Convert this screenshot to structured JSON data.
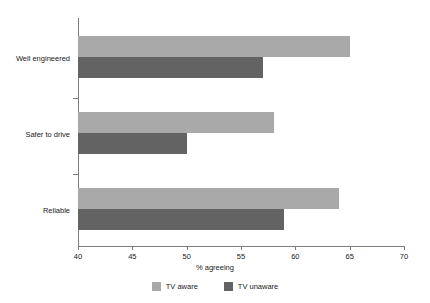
{
  "chart_data": {
    "type": "bar",
    "orientation": "horizontal",
    "title": "",
    "subtitle": "",
    "xlabel": "% agreeing",
    "ylabel": "",
    "xlim": [
      40,
      70
    ],
    "xticks": [
      40,
      45,
      50,
      55,
      60,
      65,
      70
    ],
    "xtick_labels": [
      "40",
      "45",
      "50",
      "55",
      "60",
      "65",
      "70"
    ],
    "grid": false,
    "legend_position": "bottom",
    "categories": [
      "Well engineered",
      "Safer to drive",
      "Reliable"
    ],
    "series": [
      {
        "name": "TV aware",
        "color": "#a9a9a9",
        "values": [
          65,
          58,
          64
        ]
      },
      {
        "name": "TV unaware",
        "color": "#636363",
        "values": [
          57,
          50,
          59
        ]
      }
    ]
  },
  "legend": {
    "items": [
      {
        "label": "TV aware",
        "color": "#a9a9a9"
      },
      {
        "label": "TV unaware",
        "color": "#636363"
      }
    ]
  },
  "colors": {
    "aware": "#a9a9a9",
    "unaware": "#636363",
    "axis": "#7d7d7d",
    "text": "#1a1a1a",
    "background": "#ffffff"
  }
}
